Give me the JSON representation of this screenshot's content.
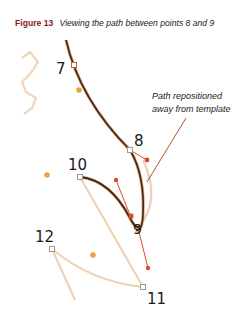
{
  "figure": {
    "number_label": "Figure 13",
    "caption": "Viewing the path between points 8 and 9",
    "annotation": {
      "line1": "Path repositioned",
      "line2": "away from template"
    },
    "points": [
      {
        "id": "7",
        "label": "7"
      },
      {
        "id": "8",
        "label": "8"
      },
      {
        "id": "9",
        "label": "9"
      },
      {
        "id": "10",
        "label": "10"
      },
      {
        "id": "11",
        "label": "11"
      },
      {
        "id": "12",
        "label": "12"
      }
    ],
    "colors": {
      "title": "#8b1a1a",
      "path": "#3a2a22",
      "path_outline": "#e8a070",
      "template": "#f0d2b4",
      "handle": "#e2452a",
      "guide_dot": "#f0a040",
      "anchor": "#9a9a9a",
      "leader": "#b0562a"
    }
  }
}
